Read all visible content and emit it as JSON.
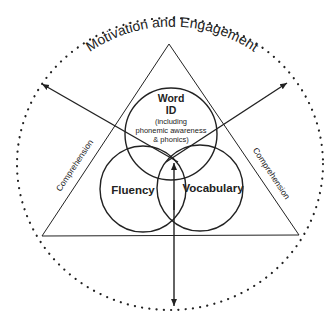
{
  "diagram": {
    "outer_label": "Motivation and Engagement",
    "side_label_left": "Comprehension",
    "side_label_right": "Comprehension",
    "circles": [
      {
        "id": "word-id",
        "title_line1": "Word",
        "title_line2": "ID",
        "sub_line1": "(including",
        "sub_line2": "phonemic awareness",
        "sub_line3": "& phonics)"
      },
      {
        "id": "fluency",
        "title": "Fluency"
      },
      {
        "id": "vocabulary",
        "title": "Vocabulary"
      }
    ],
    "colors": {
      "line": "#222222",
      "background": "#ffffff"
    }
  }
}
